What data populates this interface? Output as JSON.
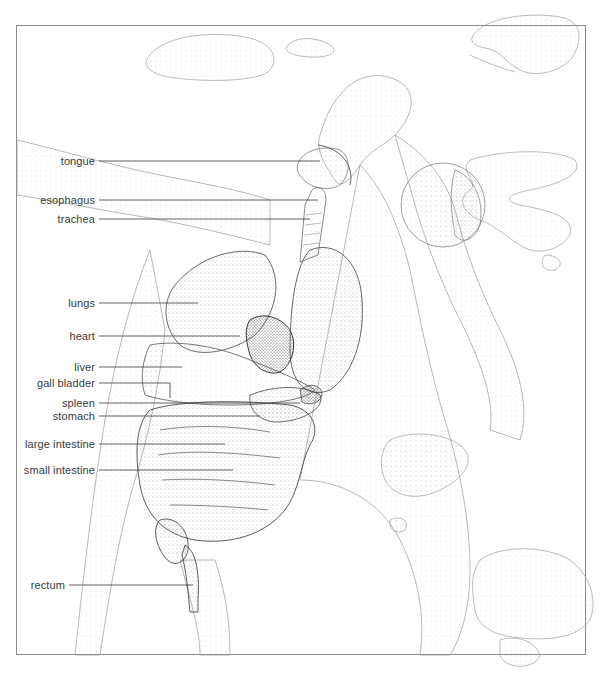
{
  "figure": {
    "title_fragment": "",
    "style": "stipple illustration",
    "frame": {
      "left": 16,
      "top": 25,
      "right": 586,
      "bottom": 655,
      "color": "#8a8a8a"
    },
    "ink_color": "#2a2a2a",
    "labels": [
      {
        "text": "tongue",
        "label_right": 95,
        "y": 161,
        "line_end_x": 320
      },
      {
        "text": "esophagus",
        "label_right": 95,
        "y": 200,
        "line_end_x": 318
      },
      {
        "text": "trachea",
        "label_right": 95,
        "y": 219,
        "line_end_x": 310
      },
      {
        "text": "lungs",
        "label_right": 95,
        "y": 303,
        "line_end_x": 198
      },
      {
        "text": "heart",
        "label_right": 95,
        "y": 336,
        "line_end_x": 240
      },
      {
        "text": "liver",
        "label_right": 95,
        "y": 367,
        "line_end_x": 182
      },
      {
        "text": "gall bladder",
        "label_right": 95,
        "y": 383,
        "line_end_x": 170,
        "elbow_down_to_y": 398
      },
      {
        "text": "spleen",
        "label_right": 95,
        "y": 403,
        "line_end_x": 300
      },
      {
        "text": "stomach",
        "label_right": 95,
        "y": 416,
        "line_end_x": 260
      },
      {
        "text": "large intestine",
        "label_right": 95,
        "y": 444,
        "line_end_x": 225
      },
      {
        "text": "small intestine",
        "label_right": 95,
        "y": 470,
        "line_end_x": 233
      },
      {
        "text": "rectum",
        "label_right": 65,
        "y": 585,
        "line_end_x": 193
      }
    ]
  }
}
